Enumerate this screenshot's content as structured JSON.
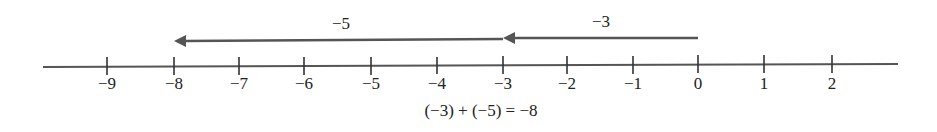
{
  "diagram": {
    "type": "number-line",
    "line_color": "#555555",
    "arrow_color": "#555555",
    "ticks": [
      {
        "value": -9,
        "label": "−9",
        "x": 107
      },
      {
        "value": -8,
        "label": "−8",
        "x": 174
      },
      {
        "value": -7,
        "label": "−7",
        "x": 239
      },
      {
        "value": -6,
        "label": "−6",
        "x": 304
      },
      {
        "value": -5,
        "label": "−5",
        "x": 371
      },
      {
        "value": -4,
        "label": "−4",
        "x": 437
      },
      {
        "value": -3,
        "label": "−3",
        "x": 503
      },
      {
        "value": -2,
        "label": "−2",
        "x": 567
      },
      {
        "value": -1,
        "label": "−1",
        "x": 633
      },
      {
        "value": 0,
        "label": "0",
        "x": 698
      },
      {
        "value": 1,
        "label": "1",
        "x": 764
      },
      {
        "value": 2,
        "label": "2",
        "x": 832
      }
    ],
    "arrows": [
      {
        "from": 0,
        "to": -3,
        "label": "−3",
        "x1": 698,
        "x2": 503,
        "y": 38
      },
      {
        "from": -3,
        "to": -8,
        "label": "−5",
        "x1": 503,
        "x2": 174,
        "y": 40
      }
    ],
    "equation": "(−3) + (−5) = −8"
  }
}
